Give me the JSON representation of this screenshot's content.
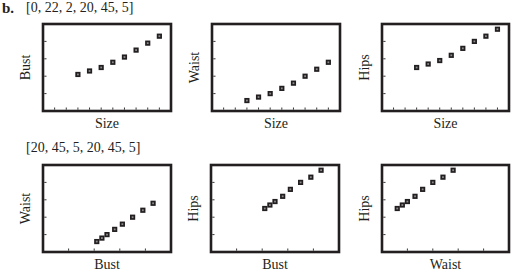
{
  "figure": {
    "part_label": "b.",
    "windows": [
      {
        "label": "[0, 22, 2, 20, 45, 5]",
        "xmin": 0,
        "xmax": 22,
        "xscl": 2,
        "ymin": 20,
        "ymax": 45,
        "yscl": 5
      },
      {
        "label": "[20, 45, 5, 20, 45, 5]",
        "xmin": 20,
        "xmax": 45,
        "xscl": 5,
        "ymin": 20,
        "ymax": 45,
        "yscl": 5
      }
    ],
    "colors": {
      "ink": "#231f20",
      "background": "#ffffff"
    }
  },
  "chart_data": [
    {
      "type": "scatter",
      "title": "",
      "xlabel": "Size",
      "ylabel": "Bust",
      "xlim": [
        0,
        22
      ],
      "ylim": [
        20,
        45
      ],
      "xtick_step": 2,
      "ytick_step": 5,
      "grid": false,
      "x": [
        6,
        8,
        10,
        12,
        14,
        16,
        18,
        20
      ],
      "y": [
        30.5,
        31.5,
        32.5,
        34,
        35.5,
        37.5,
        39.5,
        41.5
      ]
    },
    {
      "type": "scatter",
      "title": "",
      "xlabel": "Size",
      "ylabel": "Waist",
      "xlim": [
        0,
        22
      ],
      "ylim": [
        20,
        45
      ],
      "xtick_step": 2,
      "ytick_step": 5,
      "grid": false,
      "x": [
        6,
        8,
        10,
        12,
        14,
        16,
        18,
        20
      ],
      "y": [
        23,
        24,
        25,
        26.5,
        28,
        30,
        32,
        34
      ]
    },
    {
      "type": "scatter",
      "title": "",
      "xlabel": "Size",
      "ylabel": "Hips",
      "xlim": [
        0,
        22
      ],
      "ylim": [
        20,
        45
      ],
      "xtick_step": 2,
      "ytick_step": 5,
      "grid": false,
      "x": [
        6,
        8,
        10,
        12,
        14,
        16,
        18,
        20
      ],
      "y": [
        32.5,
        33.5,
        34.5,
        36,
        38,
        40,
        41.5,
        43.5
      ]
    },
    {
      "type": "scatter",
      "title": "",
      "xlabel": "Bust",
      "ylabel": "Waist",
      "xlim": [
        20,
        45
      ],
      "ylim": [
        20,
        45
      ],
      "xtick_step": 5,
      "ytick_step": 5,
      "grid": false,
      "x": [
        30.5,
        31.5,
        32.5,
        34,
        35.5,
        37.5,
        39.5,
        41.5
      ],
      "y": [
        23,
        24,
        25,
        26.5,
        28,
        30,
        32,
        34
      ]
    },
    {
      "type": "scatter",
      "title": "",
      "xlabel": "Bust",
      "ylabel": "Hips",
      "xlim": [
        20,
        45
      ],
      "ylim": [
        20,
        45
      ],
      "xtick_step": 5,
      "ytick_step": 5,
      "grid": false,
      "x": [
        30.5,
        31.5,
        32.5,
        34,
        35.5,
        37.5,
        39.5,
        41.5
      ],
      "y": [
        32.5,
        33.5,
        34.5,
        36,
        38,
        40,
        41.5,
        43.5
      ]
    },
    {
      "type": "scatter",
      "title": "",
      "xlabel": "Waist",
      "ylabel": "Hips",
      "xlim": [
        20,
        45
      ],
      "ylim": [
        20,
        45
      ],
      "xtick_step": 5,
      "ytick_step": 5,
      "grid": false,
      "x": [
        23,
        24,
        25,
        26.5,
        28,
        30,
        32,
        34
      ],
      "y": [
        32.5,
        33.5,
        34.5,
        36,
        38,
        40,
        41.5,
        43.5
      ]
    }
  ]
}
